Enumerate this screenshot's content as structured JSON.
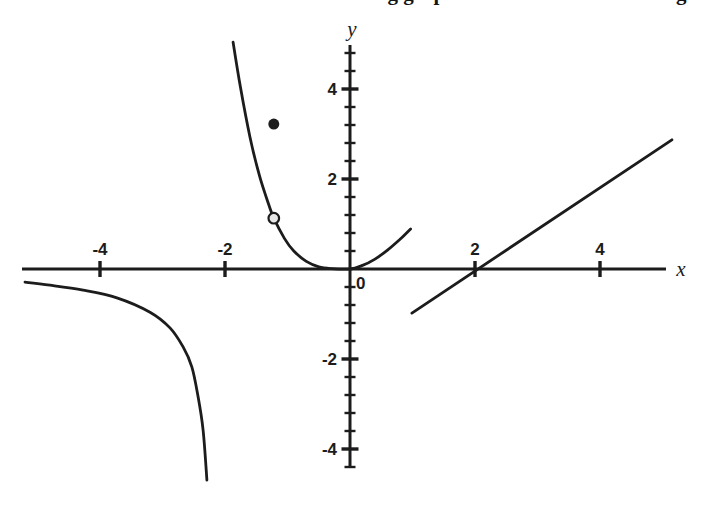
{
  "figure": {
    "cropped_title_fragment": "ing graph",
    "cropped_title_fragment_2": "g"
  },
  "chart_data": {
    "type": "line",
    "title": "",
    "subtitle": "",
    "grid": "off",
    "legend": "none",
    "axes": {
      "x": {
        "label": "x",
        "ticks": [
          -4,
          -2,
          2,
          4
        ],
        "tick_labels": [
          "-4",
          "-2",
          "2",
          "4"
        ],
        "range": [
          -5.25,
          5.06
        ],
        "origin_label": "0"
      },
      "y": {
        "label": "y",
        "ticks": [
          4,
          2,
          -2,
          -4
        ],
        "tick_labels": [
          "4",
          "2",
          "-2",
          "-4"
        ],
        "range": [
          -4.42,
          4.98
        ],
        "minor_tick_step": 0.4
      }
    },
    "series": [
      {
        "name": "parabola-branch",
        "kind": "curve",
        "points": [
          [
            -1.87,
            5.04
          ],
          [
            -1.75,
            4.02
          ],
          [
            -1.6,
            2.93
          ],
          [
            -1.45,
            2.08
          ],
          [
            -1.3,
            1.43
          ],
          [
            -1.22,
            1.13
          ],
          [
            -1.05,
            0.68
          ],
          [
            -0.9,
            0.4
          ],
          [
            -0.7,
            0.17
          ],
          [
            -0.5,
            0.05
          ],
          [
            -0.3,
            0.01
          ],
          [
            0,
            0
          ],
          [
            0.2,
            0.08
          ],
          [
            0.4,
            0.22
          ],
          [
            0.6,
            0.42
          ],
          [
            0.8,
            0.66
          ],
          [
            0.97,
            0.89
          ]
        ]
      },
      {
        "name": "linear-branch",
        "kind": "line",
        "points": [
          [
            0.99,
            -0.98
          ],
          [
            5.15,
            2.87
          ]
        ]
      },
      {
        "name": "hyperbola-branch",
        "kind": "curve",
        "points": [
          [
            -5.2,
            -0.29
          ],
          [
            -4.8,
            -0.36
          ],
          [
            -4.27,
            -0.47
          ],
          [
            -3.73,
            -0.64
          ],
          [
            -3.2,
            -0.96
          ],
          [
            -2.88,
            -1.31
          ],
          [
            -2.67,
            -1.73
          ],
          [
            -2.53,
            -2.18
          ],
          [
            -2.43,
            -2.84
          ],
          [
            -2.35,
            -3.58
          ],
          [
            -2.29,
            -4.69
          ]
        ]
      }
    ],
    "markers": [
      {
        "name": "open-point",
        "x": -1.22,
        "y": 1.13,
        "style": "open"
      },
      {
        "name": "filled-point",
        "x": -1.22,
        "y": 3.22,
        "style": "filled"
      }
    ],
    "layout": {
      "origin_px": {
        "x": 350,
        "y": 269
      },
      "px_per_unit": {
        "x": 62.5,
        "y": 45
      },
      "x_axis_px": [
        22,
        666
      ],
      "y_axis_px": [
        45,
        467
      ]
    },
    "colors": {
      "ink": "#1c1c1c",
      "background": "#ffffff",
      "open_point_fill": "#e8e8e8"
    }
  }
}
